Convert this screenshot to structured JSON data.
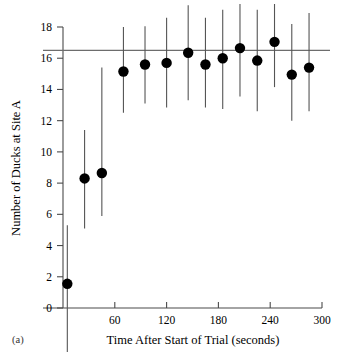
{
  "figure": {
    "panel_label": "(a)"
  },
  "chart_data": {
    "type": "scatter",
    "title": "",
    "subtitle": "",
    "xlabel": "Time After Start of Trial (seconds)",
    "ylabel": "Number of Ducks at Site A",
    "xlim": [
      0,
      300
    ],
    "ylim": [
      0,
      18
    ],
    "xticks": [
      60,
      120,
      180,
      240,
      300
    ],
    "xtick_labels": [
      "60",
      "120",
      "180",
      "240",
      "300"
    ],
    "yticks": [
      0,
      2,
      4,
      6,
      8,
      10,
      12,
      14,
      16,
      18
    ],
    "ytick_labels": [
      "0",
      "2",
      "4",
      "6",
      "8",
      "10",
      "12",
      "14",
      "16",
      "18"
    ],
    "grid": false,
    "legend": null,
    "error_bars": "vertical",
    "x": [
      5,
      25,
      45,
      70,
      95,
      120,
      145,
      165,
      185,
      205,
      225,
      245,
      265,
      285
    ],
    "values": [
      1.55,
      8.3,
      8.65,
      15.15,
      15.6,
      15.7,
      16.35,
      15.6,
      16.0,
      16.65,
      15.85,
      17.05,
      14.95,
      15.4
    ],
    "err_low": [
      -3.9,
      5.1,
      5.9,
      12.5,
      13.1,
      12.85,
      13.3,
      12.85,
      12.75,
      13.55,
      12.6,
      14.15,
      12.0,
      12.6
    ],
    "err_high": [
      5.3,
      11.4,
      15.4,
      18.0,
      18.05,
      18.6,
      19.4,
      18.6,
      19.1,
      19.8,
      19.1,
      20.4,
      18.2,
      18.9
    ],
    "annotations": [
      {
        "type": "hline",
        "name": "asymptote-reference-line",
        "y": 16.5,
        "label": ""
      }
    ],
    "marker": {
      "shape": "circle",
      "color": "#000000",
      "size": 5.2
    },
    "errorbar_color": "#555555",
    "reference_line_color": "#6d6d6d",
    "axis_color": "#4a4a4a"
  }
}
